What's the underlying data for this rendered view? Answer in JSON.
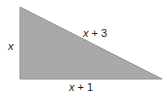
{
  "diagram": {
    "type": "right-triangle",
    "fill_color": "#a9a9a9",
    "edge_color": "#8f8f8f",
    "vertices": [
      [
        20,
        7
      ],
      [
        20,
        79
      ],
      [
        162,
        79
      ]
    ],
    "labels": {
      "vertical_side": "x",
      "hypotenuse_var": "x",
      "hypotenuse_rest": " + 3",
      "base_var": "x",
      "base_rest": " + 1"
    }
  }
}
